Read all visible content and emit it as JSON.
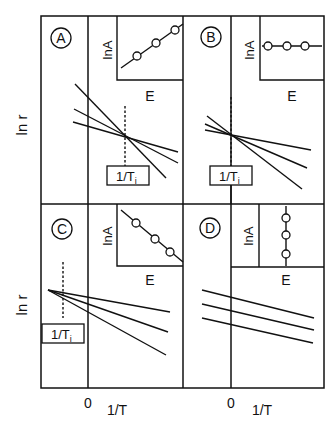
{
  "diagram": {
    "y_axis_label": "ln r",
    "x_axis_label": "1/T",
    "origin_label": "0",
    "inset_y_label": "lnA",
    "inset_x_label": "E",
    "isokinetic_label": "1/T",
    "isokinetic_subscript": "i",
    "panels": [
      {
        "id": "A",
        "label": "A",
        "inset_trend": "increasing",
        "lines": "cross at 1/Ti right of 0"
      },
      {
        "id": "B",
        "label": "B",
        "inset_trend": "constant",
        "lines": "cross at 1/Ti near 0"
      },
      {
        "id": "C",
        "label": "C",
        "inset_trend": "decreasing",
        "lines": "cross at 1/Ti left of 0"
      },
      {
        "id": "D",
        "label": "D",
        "inset_trend": "vertical",
        "lines": "parallel, no crossing"
      }
    ]
  },
  "colors": {
    "ink": "#111111",
    "background": "#ffffff"
  }
}
